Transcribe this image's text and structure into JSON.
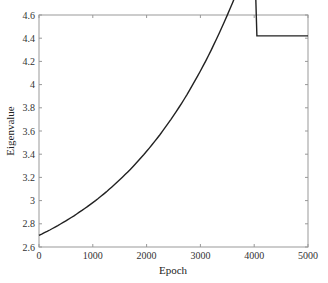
{
  "chart_data": {
    "type": "line",
    "title": "",
    "xlabel": "Epoch",
    "ylabel": "Eigenvalue",
    "xlim": [
      0,
      5000
    ],
    "ylim": [
      2.6,
      4.6
    ],
    "xticks": [
      0,
      1000,
      2000,
      3000,
      4000,
      5000
    ],
    "xtick_labels": [
      "0",
      "1000",
      "2000",
      "3000",
      "4000",
      "5000"
    ],
    "yticks": [
      2.6,
      2.8,
      3.0,
      3.2,
      3.4,
      3.6,
      3.8,
      4.0,
      4.2,
      4.4,
      4.6
    ],
    "ytick_labels": [
      "2.6",
      "2.8",
      "3",
      "3.2",
      "3.4",
      "3.6",
      "3.8",
      "4",
      "4.2",
      "4.4",
      "4.6"
    ],
    "grid": false,
    "legend": null,
    "series": [
      {
        "name": "Eigenvalue",
        "color": "#222222",
        "x": [
          0,
          500,
          1000,
          1500,
          2000,
          2500,
          3000,
          3500,
          4000,
          4500,
          5000
        ],
        "values": [
          2.7,
          2.83,
          2.97,
          3.14,
          3.33,
          3.55,
          3.8,
          4.09,
          4.42,
          4.42,
          4.42
        ]
      }
    ]
  }
}
